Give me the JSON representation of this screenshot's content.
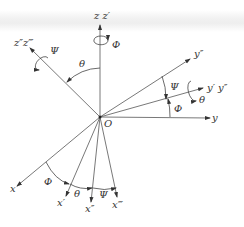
{
  "diagram": {
    "type": "euler-angle-rotation",
    "origin_label": "O",
    "axes": {
      "z": "z z′",
      "z_rot": "z″z‴",
      "y_double": "y″",
      "y_prime": "y′ y″",
      "y": "y",
      "x": "x",
      "x_prime": "x′",
      "x_double": "x″",
      "x_triple": "x‴"
    },
    "angles": {
      "phi": "Φ",
      "theta": "θ",
      "psi": "Ψ"
    },
    "colors": {
      "line": "#555555",
      "text": "#333333",
      "background": "#ffffff"
    }
  }
}
